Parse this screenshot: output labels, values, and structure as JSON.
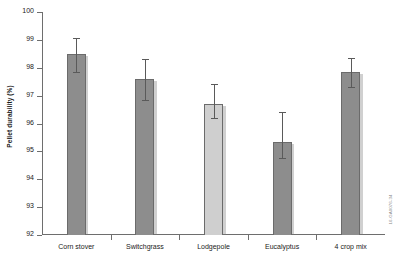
{
  "chart_data": {
    "type": "bar",
    "title": "",
    "xlabel": "",
    "ylabel": "Pellet durability (%)",
    "categories": [
      "Corn stover",
      "Switchgrass",
      "Lodgepole",
      "Eucalyptus",
      "4 crop mix"
    ],
    "values": [
      98.5,
      97.6,
      96.7,
      95.35,
      97.85
    ],
    "errors_upper": [
      99.05,
      98.3,
      97.4,
      96.4,
      98.35
    ],
    "errors_lower": [
      97.85,
      96.85,
      96.2,
      94.75,
      97.3
    ],
    "ylim": [
      92,
      100
    ],
    "yticks": [
      92,
      93,
      94,
      95,
      96,
      97,
      98,
      99,
      100
    ],
    "ytick_labels": [
      "92",
      "93",
      "94",
      "95",
      "96",
      "97",
      "98",
      "99",
      "100"
    ],
    "grid": false,
    "legend": "none",
    "bar_colors": [
      "#8d8d8d",
      "#8d8d8d",
      "#cfcfcf",
      "#8d8d8d",
      "#8d8d8d"
    ],
    "bar_edge_color": "#6b6b6b",
    "axis_color": "#6e6e6e",
    "error_bar_color": "#5a5a5a"
  },
  "side_code": "16-GA0076-34"
}
